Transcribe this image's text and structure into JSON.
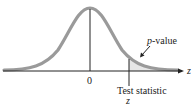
{
  "diagram": {
    "type": "normal-distribution-right-tail",
    "labels": {
      "mean": "0",
      "axis": "z",
      "p_value_italic": "p",
      "p_value_rest": "-value",
      "test_statistic": "Test statistic",
      "test_statistic_symbol": "z"
    },
    "colors": {
      "curve": "#9a9a9a",
      "axis": "#222222",
      "shaded_tail": "#e4e4e4"
    }
  }
}
